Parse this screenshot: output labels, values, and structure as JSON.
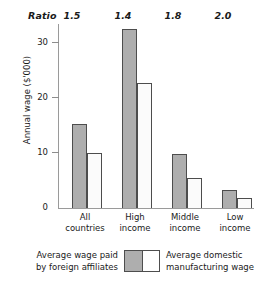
{
  "chart_data": {
    "type": "bar",
    "title": "",
    "subtitle": "",
    "xlabel": "",
    "ylabel": "Annual wage ($'000)",
    "ylim": [
      0,
      33
    ],
    "yticks": [
      0,
      10,
      20,
      30
    ],
    "ytick_labels": [
      "0",
      "10",
      "20",
      "30"
    ],
    "grid": false,
    "legend_position": "bottom",
    "categories": [
      [
        "All",
        "countries"
      ],
      [
        "High",
        "income"
      ],
      [
        "Middle",
        "income"
      ],
      [
        "Low",
        "income"
      ]
    ],
    "category_labels": [
      "All countries",
      "High income",
      "Middle income",
      "Low income"
    ],
    "series": [
      {
        "name": "Average wage paid by foreign affiliates",
        "name_lines": [
          "Average wage paid",
          "by foreign affiliates"
        ],
        "color": "#aeaeae",
        "values": [
          15.2,
          32.2,
          9.8,
          3.4
        ]
      },
      {
        "name": "Average domestic manufacturing wage",
        "name_lines": [
          "Average domestic",
          "manufacturing wage"
        ],
        "color": "#fbfbfb",
        "values": [
          10.1,
          22.6,
          5.6,
          2.0
        ]
      }
    ],
    "annotations": {
      "ratio_label": "Ratio",
      "ratio_values": [
        "1.5",
        "1.4",
        "1.8",
        "2.0"
      ]
    }
  },
  "ratio_header": {
    "label": "Ratio",
    "values": [
      "1.5",
      "1.4",
      "1.8",
      "2.0"
    ]
  },
  "axes": {
    "y_title": "Annual wage ($'000)",
    "y_ticks": [
      "30",
      "20",
      "10",
      "0"
    ]
  },
  "legend": {
    "left_lines": [
      "Average wage paid",
      "by foreign affiliates"
    ],
    "right_lines": [
      "Average domestic",
      "manufacturing wage"
    ]
  },
  "colors": {
    "bar_gray": "#aeaeae",
    "bar_white": "#fbfbfb",
    "bar_border": "#4d4d4d",
    "axis": "#9a9a9a",
    "text": "#1a1a1a"
  }
}
